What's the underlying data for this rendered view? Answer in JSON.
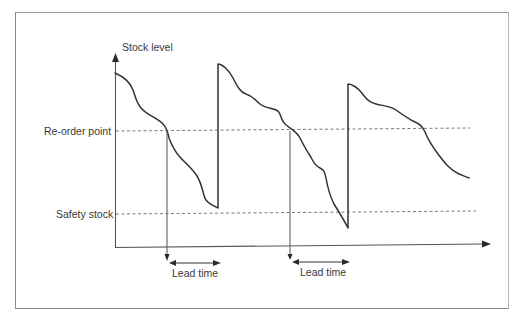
{
  "diagram": {
    "type": "inventory re-order point diagram",
    "axis": {
      "y_label": "Stock level",
      "x_label": ""
    },
    "levels": [
      {
        "name": "re-order-point",
        "label": "Re-order point"
      },
      {
        "name": "safety-stock",
        "label": "Safety stock"
      }
    ],
    "lead_times": [
      {
        "label": "Lead time"
      },
      {
        "label": "Lead time"
      }
    ],
    "colors": {
      "line": "#3a3a3a",
      "dashed": "#7a7a7a",
      "frame": "#8a8a8a"
    }
  },
  "caption": {
    "text": ""
  }
}
